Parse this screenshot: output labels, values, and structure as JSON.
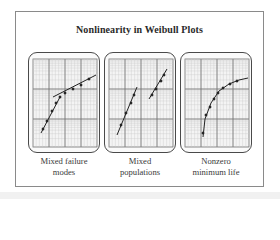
{
  "title": "Nonlinearity in Weibull Plots",
  "colors": {
    "frame": "#8a8a8a",
    "panel_border": "#4a4a4a",
    "grid_major": "#6e6e6e",
    "grid_minor": "#c9c9c9",
    "curve": "#222222",
    "text": "#3a3a3a"
  },
  "panels": [
    {
      "id": "mixed-failure-modes",
      "label_lines": [
        "Mixed failure",
        "modes"
      ],
      "pattern": "two intersecting straight lines (dog-leg)",
      "segments": [
        [
          [
            12,
            80
          ],
          [
            31,
            44
          ]
        ],
        [
          [
            24,
            44
          ],
          [
            67,
            22
          ]
        ]
      ],
      "points": [
        [
          14,
          76
        ],
        [
          18,
          68
        ],
        [
          23,
          58
        ],
        [
          27,
          50
        ],
        [
          31,
          44
        ],
        [
          36,
          40
        ],
        [
          44,
          36
        ],
        [
          52,
          32
        ],
        [
          60,
          26
        ]
      ]
    },
    {
      "id": "mixed-populations",
      "label_lines": [
        "Mixed",
        "populations"
      ],
      "pattern": "two parallel offset straight lines",
      "segments": [
        [
          [
            12,
            82
          ],
          [
            32,
            34
          ]
        ],
        [
          [
            44,
            46
          ],
          [
            62,
            16
          ]
        ]
      ],
      "points": [
        [
          16,
          72
        ],
        [
          21,
          60
        ],
        [
          26,
          50
        ],
        [
          29,
          42
        ],
        [
          47,
          42
        ],
        [
          51,
          36
        ],
        [
          56,
          28
        ],
        [
          59,
          22
        ]
      ]
    },
    {
      "id": "nonzero-minimum-life",
      "label_lines": [
        "Nonzero",
        "minimum life"
      ],
      "pattern": "concave-down curve",
      "curve": [
        [
          22,
          84
        ],
        [
          24,
          66
        ],
        [
          30,
          50
        ],
        [
          38,
          38
        ],
        [
          48,
          31
        ],
        [
          58,
          27
        ],
        [
          67,
          25
        ]
      ],
      "points": [
        [
          22,
          80
        ],
        [
          25,
          62
        ],
        [
          29,
          54
        ],
        [
          33,
          46
        ],
        [
          37,
          40
        ],
        [
          42,
          35
        ],
        [
          49,
          31
        ],
        [
          56,
          28
        ]
      ]
    }
  ]
}
